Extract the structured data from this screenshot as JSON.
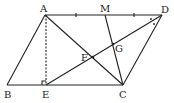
{
  "diagram": {
    "type": "geometry",
    "shape": "parallelogram ABCD",
    "points": {
      "A": {
        "label": "A",
        "x": 45,
        "y": 15,
        "lx": 40,
        "ly": 12
      },
      "D": {
        "label": "D",
        "x": 162,
        "y": 15,
        "lx": 163,
        "ly": 13
      },
      "B": {
        "label": "B",
        "x": 7,
        "y": 85,
        "lx": 4,
        "ly": 98
      },
      "C": {
        "label": "C",
        "x": 123,
        "y": 85,
        "lx": 119,
        "ly": 98
      },
      "E": {
        "label": "E",
        "x": 46,
        "y": 85,
        "lx": 42,
        "ly": 98
      },
      "M": {
        "label": "M",
        "x": 105,
        "y": 15,
        "lx": 100,
        "ly": 12
      },
      "F": {
        "label": "F",
        "x": 93,
        "y": 57,
        "lx": 81,
        "ly": 61
      },
      "G": {
        "label": "G",
        "x": 113,
        "y": 44,
        "lx": 115,
        "ly": 52
      }
    },
    "segments": [
      "AB",
      "BC",
      "CD",
      "DA",
      "AC",
      "DE",
      "MC"
    ],
    "dashed_segments": [
      "AE"
    ],
    "markers": {
      "equal_ticks": [
        "AM",
        "MD"
      ],
      "right_angle": "E",
      "angle_bisector_dots": "D"
    }
  }
}
